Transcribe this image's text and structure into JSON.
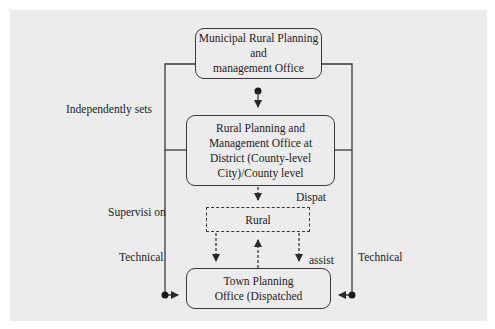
{
  "diagram": {
    "nodes": {
      "municipal_office": {
        "lines": [
          "Municipal Rural Planning",
          "and",
          "management Office"
        ]
      },
      "district_office": {
        "lines": [
          "Rural Planning and",
          "Management Office at",
          "District (County-level",
          "City)/County level"
        ]
      },
      "rural": {
        "label": "Rural"
      },
      "town_office": {
        "lines": [
          "Town Planning",
          "Office (Dispatched"
        ]
      }
    },
    "labels": {
      "independently_sets": "Independently sets",
      "dispat": "Dispat",
      "supervision": "Supervisi on",
      "technical_left": "Technical",
      "assist": "assist",
      "technical_right": "Technical"
    },
    "colors": {
      "background": "#ececec",
      "line": "#3a3a3a",
      "text": "#222222"
    }
  }
}
